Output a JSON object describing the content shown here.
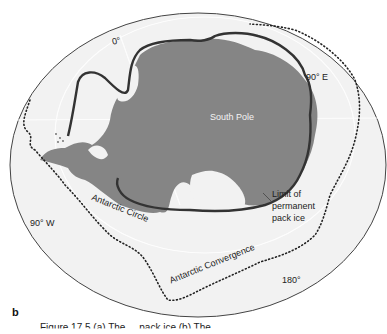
{
  "figure": {
    "panel_label": "b",
    "caption": "Figure 17.5  (a) The ... pack ice  (b) The ...",
    "labels": {
      "meridian_0": "0°",
      "meridian_90e": "90° E",
      "meridian_90w": "90° W",
      "meridian_180": "180°",
      "south_pole": "South Pole",
      "antarctic_circle": "Antarctic Circle",
      "antarctic_convergence": "Antarctic Convergence",
      "pack_ice_1": "Limit of",
      "pack_ice_2": "permanent",
      "pack_ice_3": "pack ice"
    },
    "colors": {
      "ocean": "#f2f2f2",
      "land": "#808080",
      "ice_limit": "#333333",
      "graticule": "#e6e6e6",
      "convergence": "#222222"
    }
  }
}
